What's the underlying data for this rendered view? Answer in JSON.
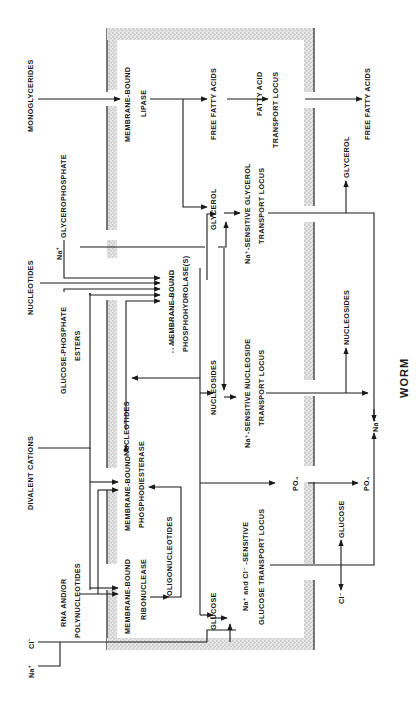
{
  "diagram": {
    "orientation": "rotated 90deg counter-clockwise",
    "organism_label": "WORM",
    "outside": {
      "monoglycerides": "MONOGLYCERIDES",
      "glycerophosphate": "GLYCEROPHOSPHATE",
      "nucleotides": "NUCLEOTIDES",
      "glucose_phosphate_esters_1": "GLUCOSE-PHOSPHATE",
      "glucose_phosphate_esters_2": "ESTERS",
      "divalent_cations": "DIVALENT   CATIONS",
      "rna_polynucleotides_1": "RNA   AND/OR",
      "rna_polynucleotides_2": "POLYNUCLEOTIDES",
      "na_ion": "Na",
      "na_sup": "+",
      "cl_ion": "Cl",
      "cl_sup": "−"
    },
    "membrane_enzymes": {
      "lipase_1": "MEMBRANE-BOUND",
      "lipase_2": "LIPASE",
      "phosphohydrolase_1": "MEMBRANE-BOUND",
      "phosphohydrolase_2": "PHOSPHOHYDROLASE(S)",
      "phosphodiesterase_1": "MEMBRANE-BOUND",
      "phosphodiesterase_2": "PHOSPHODIESTERASE",
      "ribonuclease_1": "MEMBRANE-BOUND",
      "ribonuclease_2": "RIBONUCLEASE"
    },
    "intermediates": {
      "free_fatty_acids": "FREE   FATTY   ACIDS",
      "glycerol": "GLYCEROL",
      "na_glycerol": "Na",
      "nucleotides": "NUCLEOTIDES",
      "oligonucleotides": "OLIGONUCLEOTIDES",
      "nucleosides": "NUCLEOSIDES",
      "glucose": "GLUCOSE",
      "po4_1": "PO₄"
    },
    "transport_loci": {
      "fatty_acid_1": "FATTY   ACID",
      "fatty_acid_2": "TRANSPORT   LOCUS",
      "glycerol_1": "Na⁺-SENSITIVE   GLYCEROL",
      "glycerol_2": "TRANSPORT   LOCUS",
      "nucleoside_1": "Na⁺-SENSITIVE   NUCLEOSIDE",
      "nucleoside_2": "TRANSPORT   LOCUS",
      "glucose_1": "Na⁺ and  Cl⁻ -SENSITIVE",
      "glucose_2": "GLUCOSE   TRANSPORT   LOCUS"
    },
    "inside": {
      "free_fatty_acids": "FREE   FATTY   ACIDS",
      "glycerol": "GLYCEROL",
      "nucleosides": "NUCLEOSIDES",
      "na_ion": "Na⁺",
      "po4": "PO₄",
      "glucose": "GLUCOSE",
      "cl_ion": "Cl⁻"
    }
  }
}
